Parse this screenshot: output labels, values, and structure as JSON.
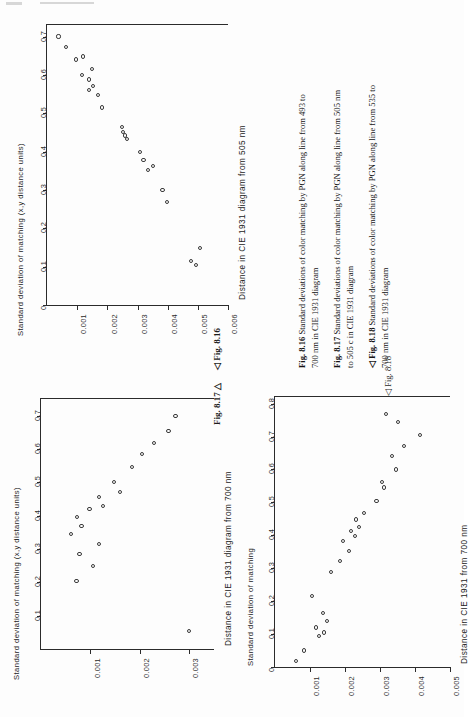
{
  "page": {
    "kind": "scanned-book-page",
    "orientation": "rotated-90-ccw",
    "background": "#fdfdfd",
    "ink": "#1a1a1a"
  },
  "figures": [
    {
      "id": "fig-8-16",
      "pointer_label": "◁ Fig. 8.16",
      "chart_data": {
        "type": "scatter",
        "title": "",
        "xlabel": "Distance in CIE 1931 diagram from 700 nm",
        "ylabel": "Standard deviation of matching (x,y distance units)",
        "xlim": [
          0,
          0.75
        ],
        "ylim": [
          0,
          0.0035
        ],
        "xticks": [
          0.1,
          0.2,
          0.3,
          0.4,
          0.5,
          0.6,
          0.7
        ],
        "xticklabels": [
          "0.1",
          "0.2",
          "0.3",
          "0.4",
          "0.5",
          "0.6",
          "0.7"
        ],
        "yticks": [
          0.001,
          0.002,
          0.003
        ],
        "yticklabels": [
          "0.001",
          "0.002",
          "0.003"
        ],
        "grid": false,
        "legend": "none",
        "points": [
          {
            "x": 0.055,
            "y": 0.003
          },
          {
            "x": 0.205,
            "y": 0.00072
          },
          {
            "x": 0.25,
            "y": 0.00105
          },
          {
            "x": 0.285,
            "y": 0.00078
          },
          {
            "x": 0.315,
            "y": 0.00118
          },
          {
            "x": 0.345,
            "y": 0.0006
          },
          {
            "x": 0.37,
            "y": 0.00082
          },
          {
            "x": 0.395,
            "y": 0.00073
          },
          {
            "x": 0.42,
            "y": 0.00098
          },
          {
            "x": 0.43,
            "y": 0.00125
          },
          {
            "x": 0.455,
            "y": 0.00118
          },
          {
            "x": 0.47,
            "y": 0.0016
          },
          {
            "x": 0.5,
            "y": 0.00148
          },
          {
            "x": 0.545,
            "y": 0.00184
          },
          {
            "x": 0.585,
            "y": 0.00205
          },
          {
            "x": 0.618,
            "y": 0.00228
          },
          {
            "x": 0.655,
            "y": 0.00258
          },
          {
            "x": 0.7,
            "y": 0.00272
          }
        ]
      }
    },
    {
      "id": "fig-8-17",
      "pointer_label": "Fig. 8.17 △",
      "chart_data": {
        "type": "scatter",
        "title": "",
        "xlabel": "Distance in CIE 1931 diagram from 505 nm",
        "ylabel": "Standard deviation of matching (x,y distance units)",
        "xlim": [
          0,
          0.73
        ],
        "ylim": [
          0,
          0.006
        ],
        "xticks": [
          0,
          0.1,
          0.2,
          0.3,
          0.4,
          0.5,
          0.6,
          0.7
        ],
        "xticklabels": [
          "0",
          "0.1",
          "0.2",
          "0.3",
          "0.4",
          "0.5",
          "0.6",
          "0.7"
        ],
        "yticks": [
          0.001,
          0.002,
          0.003,
          0.004,
          0.005,
          0.006
        ],
        "yticklabels": [
          "0.001",
          "0.002",
          "0.003",
          "0.004",
          "0.005",
          "0.006"
        ],
        "grid": false,
        "legend": "none",
        "points": [
          {
            "x": 0.105,
            "y": 0.00493
          },
          {
            "x": 0.115,
            "y": 0.00478
          },
          {
            "x": 0.148,
            "y": 0.00508
          },
          {
            "x": 0.268,
            "y": 0.00398
          },
          {
            "x": 0.3,
            "y": 0.00383
          },
          {
            "x": 0.352,
            "y": 0.00335
          },
          {
            "x": 0.362,
            "y": 0.00352
          },
          {
            "x": 0.378,
            "y": 0.0032
          },
          {
            "x": 0.398,
            "y": 0.00308
          },
          {
            "x": 0.432,
            "y": 0.00265
          },
          {
            "x": 0.442,
            "y": 0.00258
          },
          {
            "x": 0.452,
            "y": 0.00252
          },
          {
            "x": 0.464,
            "y": 0.00248
          },
          {
            "x": 0.515,
            "y": 0.00182
          },
          {
            "x": 0.548,
            "y": 0.00168
          },
          {
            "x": 0.56,
            "y": 0.0014
          },
          {
            "x": 0.572,
            "y": 0.00152
          },
          {
            "x": 0.588,
            "y": 0.00138
          },
          {
            "x": 0.6,
            "y": 0.00115
          },
          {
            "x": 0.615,
            "y": 0.00148
          },
          {
            "x": 0.64,
            "y": 0.00095
          },
          {
            "x": 0.648,
            "y": 0.00118
          },
          {
            "x": 0.672,
            "y": 0.00062
          },
          {
            "x": 0.7,
            "y": 0.00038
          }
        ]
      }
    },
    {
      "id": "fig-8-18",
      "pointer_label": "◁ Fig. 8.18",
      "chart_data": {
        "type": "scatter",
        "title": "",
        "xlabel": "Distance in CIE 1931 from 700 nm",
        "ylabel": "Standard deviation of matching",
        "xlim": [
          0,
          0.82
        ],
        "ylim": [
          0,
          0.005
        ],
        "xticks": [
          0,
          0.1,
          0.2,
          0.3,
          0.4,
          0.5,
          0.6,
          0.7,
          0.8
        ],
        "xticklabels": [
          "0",
          "0.1",
          "0.2",
          "0.3",
          "0.4",
          "0.5",
          "0.6",
          "0.7",
          "0.8"
        ],
        "yticks": [
          0.001,
          0.002,
          0.003,
          0.004,
          0.005
        ],
        "yticklabels": [
          "0.001",
          "0.002",
          "0.003",
          "0.004",
          "0.005"
        ],
        "grid": false,
        "legend": "none",
        "points": [
          {
            "x": 0.018,
            "y": 0.0006
          },
          {
            "x": 0.05,
            "y": 0.00082
          },
          {
            "x": 0.095,
            "y": 0.00125
          },
          {
            "x": 0.105,
            "y": 0.0014
          },
          {
            "x": 0.12,
            "y": 0.00118
          },
          {
            "x": 0.14,
            "y": 0.00148
          },
          {
            "x": 0.165,
            "y": 0.00138
          },
          {
            "x": 0.215,
            "y": 0.00105
          },
          {
            "x": 0.288,
            "y": 0.0016
          },
          {
            "x": 0.322,
            "y": 0.00185
          },
          {
            "x": 0.352,
            "y": 0.00212
          },
          {
            "x": 0.382,
            "y": 0.00195
          },
          {
            "x": 0.398,
            "y": 0.00228
          },
          {
            "x": 0.412,
            "y": 0.00218
          },
          {
            "x": 0.425,
            "y": 0.0024
          },
          {
            "x": 0.448,
            "y": 0.00232
          },
          {
            "x": 0.468,
            "y": 0.00255
          },
          {
            "x": 0.505,
            "y": 0.0029
          },
          {
            "x": 0.545,
            "y": 0.00312
          },
          {
            "x": 0.562,
            "y": 0.00305
          },
          {
            "x": 0.6,
            "y": 0.00345
          },
          {
            "x": 0.64,
            "y": 0.00335
          },
          {
            "x": 0.672,
            "y": 0.00368
          },
          {
            "x": 0.705,
            "y": 0.00415
          },
          {
            "x": 0.745,
            "y": 0.00352
          },
          {
            "x": 0.768,
            "y": 0.00318
          }
        ]
      }
    }
  ],
  "captions": [
    {
      "id": "caption-8-16",
      "number": "8.16",
      "prefix": "Fig.",
      "line1": "Standard deviations of color matching by PGN along line from 493 to",
      "line2": "700 nm in CIE 1931 diagram"
    },
    {
      "id": "caption-8-17",
      "number": "8.17",
      "prefix": "Fig.",
      "line1": "Standard deviations of color matching by PGN along line from 505 nm",
      "line2": "to 505 c in CIE 1931 diagram"
    },
    {
      "id": "caption-8-18",
      "number": "8.18",
      "prefix": "◁ Fig.",
      "line1": "Standard deviations of color matching by PGN along line from 535 to",
      "line2": "700 nm in CIE 1931 diagram"
    }
  ]
}
